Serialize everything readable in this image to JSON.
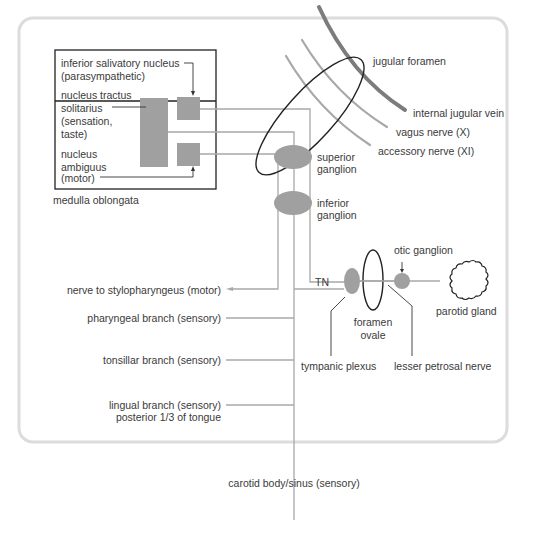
{
  "diagram": {
    "colors": {
      "frame": "#dcdcdc",
      "nerve_line": "#a8a8a8",
      "nucleus_fill": "#a0a0a0",
      "ganglion_fill": "#a0a0a0",
      "vein": "#7c7c7c",
      "outline": "#222222",
      "text": "#3a3a3a"
    },
    "medulla": {
      "label": "medulla oblongata",
      "nuclei": {
        "inferior_salivatory_line1": "inferior salivatory nucleus",
        "inferior_salivatory_line2": "(parasympathetic)",
        "tractus_line1": "nucleus tractus",
        "tractus_line2": "solitarius",
        "tractus_line3": "(sensation,",
        "tractus_line4": "taste)",
        "ambiguus_line1": "nucleus",
        "ambiguus_line2": "ambiguus",
        "ambiguus_line3": "(motor)"
      }
    },
    "foramen": {
      "jugular_foramen": "jugular foramen",
      "internal_jugular_vein": "internal jugular vein",
      "vagus_nerve": "vagus nerve (X)",
      "accessory_nerve": "accessory nerve (XI)"
    },
    "ganglia": {
      "superior_line1": "superior",
      "superior_line2": "ganglion",
      "inferior_line1": "inferior",
      "inferior_line2": "ganglion",
      "otic": "otic ganglion"
    },
    "branches": {
      "stylopharyngeus": "nerve to stylopharyngeus (motor)",
      "pharyngeal": "pharyngeal branch (sensory)",
      "tonsillar": "tonsillar branch (sensory)",
      "lingual_line1": "lingual branch (sensory)",
      "lingual_line2": "posterior 1/3 of tongue",
      "carotid": "carotid body/sinus (sensory)"
    },
    "parasympathetic": {
      "tn": "TN",
      "foramen_ovale_line1": "foramen",
      "foramen_ovale_line2": "ovale",
      "tympanic_plexus": "tympanic plexus",
      "lesser_petrosal": "lesser petrosal nerve",
      "parotid_gland": "parotid gland"
    }
  }
}
